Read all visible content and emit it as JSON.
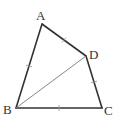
{
  "figure": {
    "type": "quadrilateral",
    "vertices": [
      {
        "name": "A",
        "label": "A"
      },
      {
        "name": "B",
        "label": "B"
      },
      {
        "name": "C",
        "label": "C"
      },
      {
        "name": "D",
        "label": "D"
      }
    ],
    "sides": [
      {
        "from": "A",
        "to": "D",
        "tick_marks": 1
      },
      {
        "from": "D",
        "to": "C",
        "tick_marks": 1
      },
      {
        "from": "C",
        "to": "B",
        "tick_marks": 1
      },
      {
        "from": "B",
        "to": "A",
        "tick_marks": 1
      }
    ],
    "segments": [
      {
        "from": "B",
        "to": "D",
        "style": "thin"
      }
    ],
    "colors": {
      "line": "#333333",
      "diagonal": "#777777",
      "background": "#ffffff"
    }
  }
}
